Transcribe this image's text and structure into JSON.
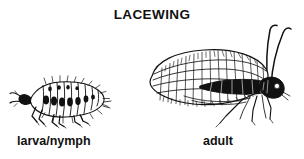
{
  "page": {
    "title": "LACEWING",
    "background_color": "#ffffff",
    "ink_color": "#111111",
    "width": 304,
    "height": 159,
    "style": "black and white line drawing / engraving"
  },
  "figures": [
    {
      "id": "larva",
      "caption": "larva/nymph",
      "subject": "lacewing larva (aphid lion)",
      "orientation": "facing left, side view",
      "features": [
        "segmented hairy body",
        "sickle mandibles",
        "six legs",
        "tapered abdomen"
      ]
    },
    {
      "id": "adult",
      "caption": "adult",
      "subject": "adult green lacewing",
      "orientation": "facing right, side view",
      "features": [
        "large net-veined wing",
        "two long curved antennae",
        "dark head with eye",
        "six thin legs"
      ]
    }
  ],
  "captions": {
    "larva": "larva/nymph",
    "adult": "adult"
  }
}
